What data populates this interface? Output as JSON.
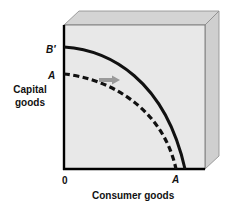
{
  "diagram": {
    "type": "production-possibilities-frontier",
    "y_axis_label": "Capital goods",
    "x_axis_label": "Consumer goods",
    "origin_label": "0",
    "y_intercept_labels": {
      "new_frontier": "B′",
      "original_frontier": "A"
    },
    "x_intercept_label": "A",
    "curves": [
      {
        "name": "new-frontier",
        "style": "solid",
        "label": "B′"
      },
      {
        "name": "original-frontier",
        "style": "dashed",
        "label": "A"
      }
    ],
    "arrow": {
      "direction": "right",
      "meaning": "outward shift of frontier"
    },
    "colors": {
      "box_face": "#e6e6e6",
      "box_top": "#d2d2d2",
      "box_side": "#cccccc",
      "curve": "#111111",
      "arrow": "#9a9a9a"
    }
  }
}
